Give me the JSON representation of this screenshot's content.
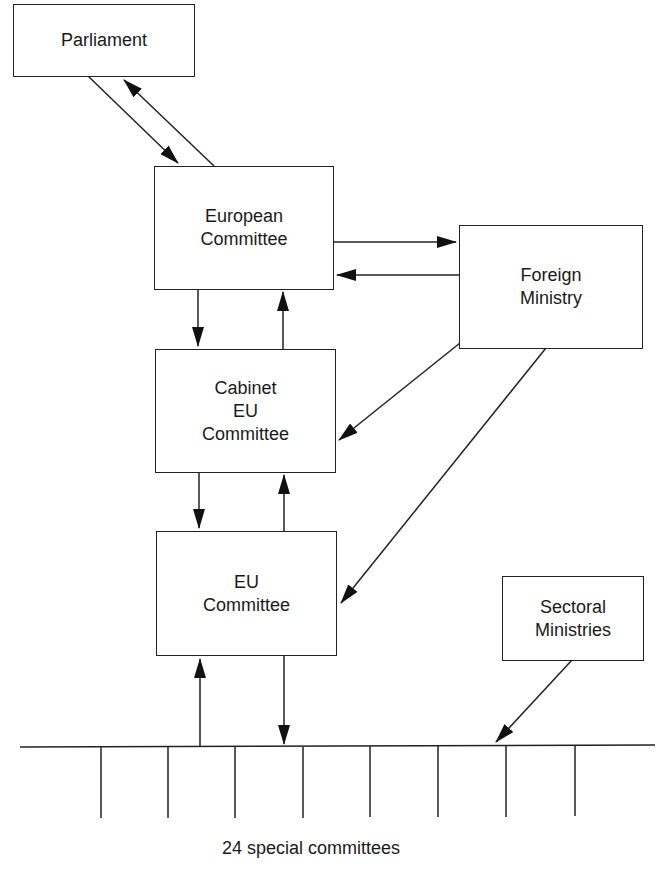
{
  "diagram": {
    "nodes": {
      "parliament": {
        "lines": [
          "Parliament"
        ]
      },
      "european_committee": {
        "lines": [
          "European",
          "Committee"
        ]
      },
      "foreign_ministry": {
        "lines": [
          "Foreign",
          "Ministry"
        ]
      },
      "cabinet_eu_committee": {
        "lines": [
          "Cabinet",
          "EU",
          "Committee"
        ]
      },
      "eu_committee": {
        "lines": [
          "EU",
          "Committee"
        ]
      },
      "sectoral_ministries": {
        "lines": [
          "Sectoral",
          "Ministries"
        ]
      }
    },
    "bus": {
      "label": "24 special committees",
      "tick_count": 8
    },
    "edges": [
      {
        "from": "parliament",
        "to": "european_committee"
      },
      {
        "from": "european_committee",
        "to": "parliament"
      },
      {
        "from": "european_committee",
        "to": "foreign_ministry"
      },
      {
        "from": "foreign_ministry",
        "to": "european_committee"
      },
      {
        "from": "european_committee",
        "to": "cabinet_eu_committee"
      },
      {
        "from": "cabinet_eu_committee",
        "to": "european_committee"
      },
      {
        "from": "foreign_ministry",
        "to": "cabinet_eu_committee"
      },
      {
        "from": "foreign_ministry",
        "to": "eu_committee"
      },
      {
        "from": "cabinet_eu_committee",
        "to": "eu_committee"
      },
      {
        "from": "eu_committee",
        "to": "cabinet_eu_committee"
      },
      {
        "from": "eu_committee",
        "to": "special_committees"
      },
      {
        "from": "special_committees",
        "to": "eu_committee"
      },
      {
        "from": "sectoral_ministries",
        "to": "special_committees"
      }
    ]
  }
}
